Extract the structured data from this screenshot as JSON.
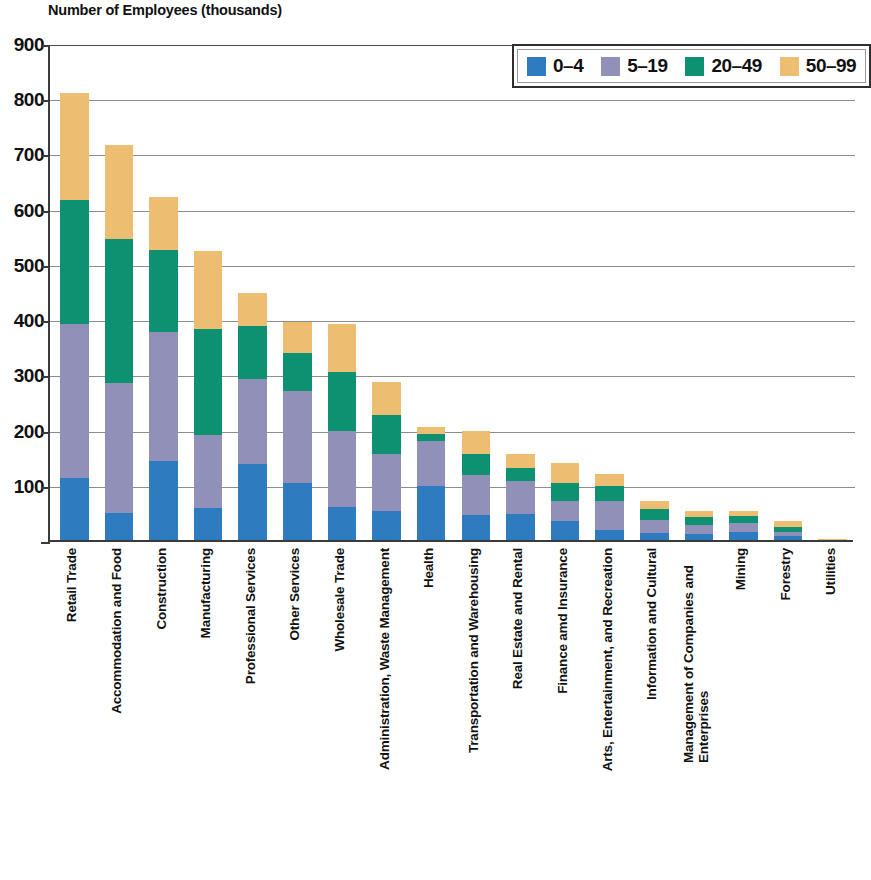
{
  "chart_data": {
    "type": "bar",
    "subtype": "stacked-vertical",
    "title": "Number of Employees (thousands)",
    "xlabel": "",
    "ylabel": "Number of Employees (thousands)",
    "ylim": [
      0,
      900
    ],
    "ytick_step": 100,
    "yticks": [
      "900",
      "800",
      "700",
      "600",
      "500",
      "400",
      "300",
      "200",
      "100",
      "0"
    ],
    "grid": true,
    "legend_position": "top-right",
    "categories": [
      "Retail Trade",
      "Accommodation and Food",
      "Construction",
      "Manufacturing",
      "Professional Services",
      "Other Services",
      "Wholesale Trade",
      "Administration, Waste Management",
      "Health",
      "Transportation and Warehousing",
      "Real Estate and Rental",
      "Finance amd Insurance",
      "Arts, Entertainment, and Recreation",
      "Information and Cultural",
      "Management of Companies and Enterprises",
      "Mining",
      "Forestry",
      "Utilities"
    ],
    "series": [
      {
        "name": "0–4",
        "color": "#2e7bc0",
        "values": [
          113,
          49,
          143,
          58,
          138,
          103,
          59,
          53,
          98,
          45,
          47,
          35,
          18,
          13,
          10,
          14,
          7,
          0
        ]
      },
      {
        "name": "5–19",
        "color": "#9090b8",
        "values": [
          279,
          236,
          233,
          133,
          153,
          166,
          138,
          103,
          82,
          72,
          59,
          36,
          53,
          24,
          18,
          16,
          7,
          0
        ]
      },
      {
        "name": "20–49",
        "color": "#0e9171",
        "values": [
          223,
          261,
          149,
          191,
          96,
          70,
          108,
          71,
          12,
          38,
          25,
          33,
          26,
          19,
          14,
          13,
          10,
          0
        ]
      },
      {
        "name": "50–99",
        "color": "#edbe72",
        "values": [
          195,
          169,
          96,
          142,
          61,
          55,
          87,
          60,
          12,
          42,
          24,
          36,
          23,
          14,
          11,
          9,
          11,
          2
        ]
      }
    ],
    "totals": [
      810,
      715,
      621,
      524,
      448,
      394,
      392,
      287,
      204,
      197,
      155,
      140,
      120,
      70,
      53,
      52,
      35,
      2
    ]
  },
  "legend": {
    "items": [
      {
        "label": "0–4",
        "color": "#2e7bc0"
      },
      {
        "label": "5–19",
        "color": "#9090b8"
      },
      {
        "label": "20–49",
        "color": "#0e9171"
      },
      {
        "label": "50–99",
        "color": "#edbe72"
      }
    ]
  },
  "axes": {
    "y_max": 900,
    "y_min": 0,
    "y_tick_labels": [
      "900",
      "800",
      "700",
      "600",
      "500",
      "400",
      "300",
      "200",
      "100",
      "0"
    ]
  },
  "colors": {
    "axis": "#3a3a3a",
    "gridline": "#8d8d8d",
    "background": "#ffffff",
    "text": "#111111"
  }
}
